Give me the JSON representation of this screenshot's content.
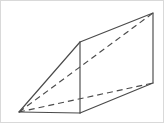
{
  "figure": {
    "kind": "3d-solid-geometry-figure",
    "solid_name": "triangular prism",
    "background_color": "#ffffff",
    "border_color": "#d9d9d9",
    "stroke_color": "#4a4a4a",
    "stroke_width": 1.15,
    "dash_pattern": "6 4",
    "canvas": {
      "width": 164,
      "height": 123
    },
    "labels": [],
    "vertices": [
      {
        "id": "A",
        "name": "front-apex-left",
        "x": 18,
        "y": 111,
        "hidden": false
      },
      {
        "id": "B",
        "name": "front-bottom-right",
        "x": 79,
        "y": 112,
        "hidden": false
      },
      {
        "id": "C",
        "name": "front-top",
        "x": 79,
        "y": 41,
        "hidden": false
      },
      {
        "id": "D",
        "name": "back-top-right",
        "x": 152,
        "y": 12,
        "hidden": false
      },
      {
        "id": "E",
        "name": "back-bottom-right",
        "x": 152,
        "y": 82,
        "hidden": false
      },
      {
        "id": "F",
        "name": "back-apex-left-hidden",
        "x": 18,
        "y": 111,
        "hidden": true
      }
    ],
    "edges_solid": [
      {
        "name": "bottom-front-edge",
        "from": "A",
        "to": "B",
        "points": "18,111 79,112"
      },
      {
        "name": "front-hypotenuse-edge",
        "from": "A",
        "to": "C",
        "points": "18,111 79,41"
      },
      {
        "name": "front-vertical-edge",
        "from": "C",
        "to": "B",
        "points": "79,41 79,112"
      },
      {
        "name": "top-right-slant-edge",
        "from": "C",
        "to": "D",
        "points": "79,41 152,12"
      },
      {
        "name": "bottom-right-slant-edge",
        "from": "B",
        "to": "E",
        "points": "79,112 152,82"
      },
      {
        "name": "back-vertical-right-edge",
        "from": "D",
        "to": "E",
        "points": "152,12 152,82"
      }
    ],
    "edges_dashed": [
      {
        "name": "hidden-top-diagonal-edge",
        "from": "A",
        "to": "D",
        "points": "18,111 152,12"
      },
      {
        "name": "hidden-bottom-diagonal-edge",
        "from": "A",
        "to": "E",
        "points": "18,111 152,82"
      }
    ]
  }
}
